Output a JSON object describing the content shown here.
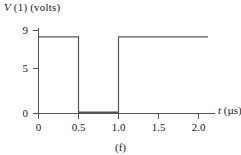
{
  "figure": {
    "caption": "(f)",
    "yaxis_title_prefix": "V",
    "yaxis_title_rest": " (1) (volts)",
    "xaxis_title_prefix": "t",
    "xaxis_title_rest": " (µs)",
    "trace_color": "#555555",
    "axis_color": "#555555",
    "text_color": "#1a1a1a"
  },
  "chart_data": {
    "type": "line",
    "title": "",
    "subtitle": "(f)",
    "xlabel": "t (µs)",
    "ylabel": "V (1) (volts)",
    "xlim": [
      0,
      2.15
    ],
    "ylim": [
      0,
      9.6
    ],
    "xticks": [
      0,
      0.5,
      1.0,
      1.5,
      2.0
    ],
    "xtick_labels": [
      "0",
      "0.5",
      "1.0",
      "1.5",
      "2.0"
    ],
    "yticks": [
      0,
      5,
      9
    ],
    "ytick_labels": [
      "0",
      "5",
      "9"
    ],
    "grid": false,
    "legend": false,
    "series": [
      {
        "name": "V(1)",
        "x": [
          0,
          0.5,
          0.5,
          1.0,
          1.0,
          2.12
        ],
        "y": [
          8.3,
          8.3,
          0,
          0,
          8.3,
          8.3
        ]
      }
    ],
    "annotations": [
      "High level approximately 8.3 volts",
      "Pulse low between t = 0.5 and t = 1.0 microseconds"
    ]
  }
}
